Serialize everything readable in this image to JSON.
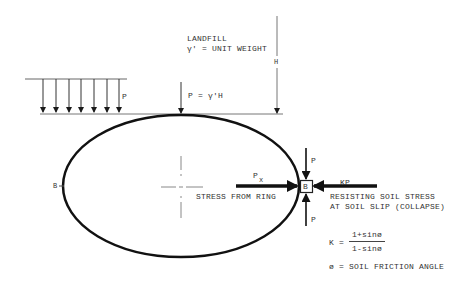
{
  "diagram": {
    "title_block": {
      "landfill": "LANDFILL",
      "unit_weight": "γ′ = UNIT WEIGHT",
      "depth_label": "H"
    },
    "loads": {
      "distributed_load_label": "P",
      "point_load_label": "P = γ′H",
      "distributed_arrow_count": 7
    },
    "ring": {
      "shape": "ellipse",
      "left_point_label": "B",
      "stress_from_ring_label": "P",
      "stress_from_ring_subscript": "x",
      "stress_from_ring_text": "STRESS FROM RING"
    },
    "element_b": {
      "label": "B",
      "top_load_label": "P",
      "bottom_load_label": "P",
      "resisting_load_label": "KP",
      "resisting_text_line1": "RESISTING SOIL STRESS",
      "resisting_text_line2": "AT SOIL SLIP (COLLAPSE)"
    },
    "formula": {
      "lhs": "K =",
      "numerator": "1+sinø",
      "denominator": "1-sinø",
      "phi_definition": "ø = SOIL FRICTION ANGLE"
    },
    "colors": {
      "ink": "#1a1a1a",
      "thin_line": "#666666",
      "background": "#ffffff"
    }
  }
}
